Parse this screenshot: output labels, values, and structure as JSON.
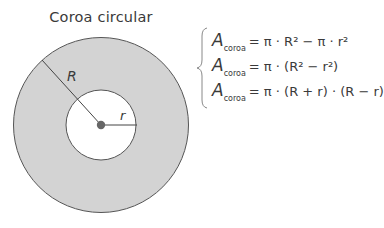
{
  "title": "Coroa circular",
  "diagram": {
    "outer_radius_label": "R",
    "inner_radius_label": "r",
    "colors": {
      "ring_fill": "#d3d3d3",
      "stroke": "#555555",
      "center_dot": "#666666",
      "inner_fill": "#ffffff"
    }
  },
  "formulas": [
    {
      "lhs": "A",
      "sub": "coroa",
      "rhs": "= π · R² − π · r²"
    },
    {
      "lhs": "A",
      "sub": "coroa",
      "rhs": "= π · (R² − r²)"
    },
    {
      "lhs": "A",
      "sub": "coroa",
      "rhs": "= π · (R + r) · (R − r)"
    }
  ]
}
